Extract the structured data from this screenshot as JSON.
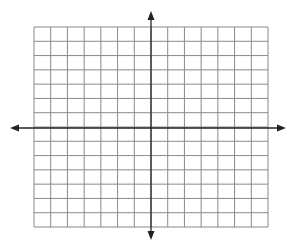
{
  "diagram": {
    "type": "coordinate-plane",
    "grid": {
      "columns": 14,
      "rows": 14,
      "left": 34,
      "top": 27,
      "right": 268,
      "bottom": 227,
      "line_color": "#8a8a8a",
      "line_width": 1
    },
    "axes": {
      "origin_x": 151,
      "origin_y": 128,
      "color": "#222222",
      "line_width": 1.3,
      "x_axis": {
        "from": 10,
        "to": 286
      },
      "y_axis": {
        "from": 11,
        "to": 240
      },
      "arrowheads": [
        "up",
        "down",
        "left",
        "right"
      ]
    },
    "background": "#ffffff"
  }
}
